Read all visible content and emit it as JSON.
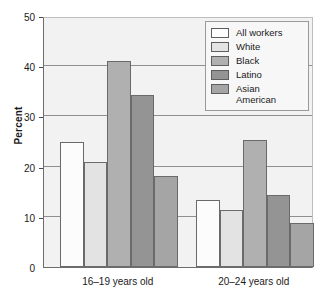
{
  "chart_data": {
    "type": "bar",
    "title": "",
    "xlabel": "",
    "ylabel": "Percent",
    "ylim": [
      0,
      50
    ],
    "yticks": [
      0,
      10,
      20,
      30,
      40,
      50
    ],
    "ytick_labels": [
      "0",
      "10",
      "20",
      "30",
      "40",
      "50"
    ],
    "grid": true,
    "grid_axis": "y",
    "legend_position": "top-right",
    "categories": [
      "16–19 years old",
      "20–24 years old"
    ],
    "series": [
      {
        "name": "All workers",
        "values": [
          25.0,
          13.4
        ],
        "color": "#fcfcfc"
      },
      {
        "name": "White",
        "values": [
          21.0,
          11.4
        ],
        "color": "#e3e3e3"
      },
      {
        "name": "Black",
        "values": [
          41.0,
          25.4
        ],
        "color": "#b0b0b0"
      },
      {
        "name": "Latino",
        "values": [
          34.2,
          14.4
        ],
        "color": "#949494"
      },
      {
        "name": "Asian\nAmerican",
        "values": [
          18.2,
          8.8
        ],
        "color": "#a5a5a5"
      }
    ]
  },
  "legend": {
    "items": [
      {
        "label": "All workers",
        "swatch": "#fcfcfc"
      },
      {
        "label": "White",
        "swatch": "#e3e3e3"
      },
      {
        "label": "Black",
        "swatch": "#b0b0b0"
      },
      {
        "label": "Latino",
        "swatch": "#949494"
      },
      {
        "label": "Asian\nAmerican",
        "swatch": "#a5a5a5"
      }
    ]
  },
  "axis": {
    "y_title": "Percent",
    "y_tick_labels": [
      "50",
      "40",
      "30",
      "20",
      "10",
      "0"
    ],
    "x_group_labels": [
      "16–19 years old",
      "20–24 years old"
    ]
  }
}
